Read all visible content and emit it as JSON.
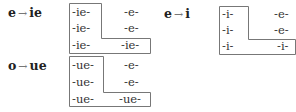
{
  "tables": [
    {
      "id": "e-ie",
      "label": {
        "from": "e",
        "arrow": "→",
        "to": "ie"
      },
      "rows": [
        [
          "-ie-",
          "-e-"
        ],
        [
          "-ie-",
          "-e-"
        ],
        [
          "-ie-",
          "-ie-"
        ]
      ]
    },
    {
      "id": "e-i",
      "label": {
        "from": "e",
        "arrow": "→",
        "to": "i"
      },
      "rows": [
        [
          "-i-",
          "-e-"
        ],
        [
          "-i-",
          "-e-"
        ],
        [
          "-i-",
          "-i-"
        ]
      ]
    },
    {
      "id": "o-ue",
      "label": {
        "from": "o",
        "arrow": "→",
        "to": "ue"
      },
      "rows": [
        [
          "-ue-",
          "-e-"
        ],
        [
          "-ue-",
          "-e-"
        ],
        [
          "-ue-",
          "-ue-"
        ]
      ]
    }
  ],
  "colors": {
    "box_border": "#777777",
    "text": "#333333",
    "arrow": "#777777"
  }
}
